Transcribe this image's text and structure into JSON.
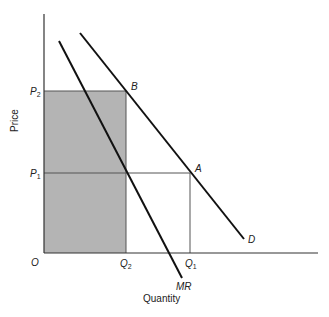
{
  "diagram": {
    "type": "monopoly price and output",
    "colors": {
      "background": "#ffffff",
      "line": "#111111",
      "axis": "#333333",
      "guide": "#555555",
      "shade": "#b4b4b4"
    },
    "axes": {
      "x_label": "Quantity",
      "y_label": "Price",
      "origin_label": "O"
    },
    "curves": [
      {
        "id": "D",
        "label": "D",
        "description": "Demand curve",
        "from": [
          80,
          33
        ],
        "to": [
          244,
          239
        ]
      },
      {
        "id": "MR",
        "label": "MR",
        "description": "Marginal revenue curve",
        "from": [
          59,
          41
        ],
        "to": [
          182,
          278
        ]
      }
    ],
    "points": [
      {
        "id": "B",
        "label": "B",
        "x": 126,
        "y": 91
      },
      {
        "id": "A",
        "label": "A",
        "x": 190,
        "y": 173
      }
    ],
    "price_ticks": [
      {
        "label": "P",
        "sub": "2",
        "y": 91
      },
      {
        "label": "P",
        "sub": "1",
        "y": 173
      }
    ],
    "quantity_ticks": [
      {
        "label": "Q",
        "sub": "2",
        "x": 126
      },
      {
        "label": "Q",
        "sub": "1",
        "x": 190
      }
    ],
    "shaded_region": {
      "description": "Rectangle from origin to (Q2, P2)",
      "x0": 44,
      "y0": 91,
      "x1": 126,
      "y1": 253
    }
  }
}
